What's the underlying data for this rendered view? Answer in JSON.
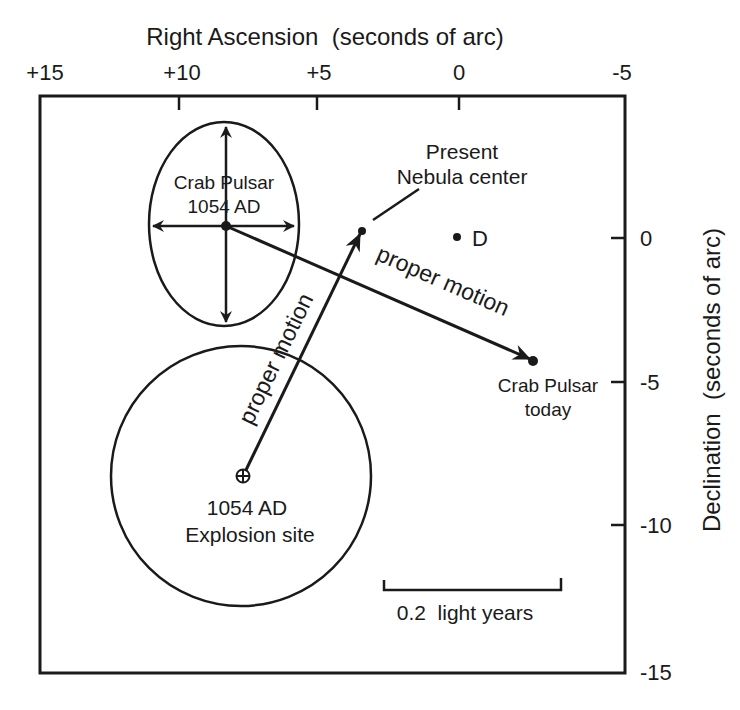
{
  "figure": {
    "x_axis": {
      "title": "Right Ascension  (seconds of arc)",
      "ticks": [
        "+15",
        "+10",
        "+5",
        "0",
        "-5"
      ]
    },
    "y_axis": {
      "title": "Declination  (seconds of arc)",
      "ticks": [
        "0",
        "-5",
        "-10",
        "-15"
      ]
    },
    "labels": {
      "pulsar_1054_line1": "Crab Pulsar",
      "pulsar_1054_line2": "1054 AD",
      "nebula_line1": "Present",
      "nebula_line2": "Nebula center",
      "point_d": "D",
      "motion_pulsar": "proper motion",
      "motion_nebula": "proper motion",
      "pulsar_today_line1": "Crab Pulsar",
      "pulsar_today_line2": "today",
      "explosion_line1": "1054 AD",
      "explosion_line2": "Explosion site",
      "scale_bar": "0.2  light years"
    },
    "points": {
      "pulsar_1054": {
        "ra": 8.5,
        "dec": 0.4
      },
      "nebula_center": {
        "ra": 3.4,
        "dec": 0.2
      },
      "point_d": {
        "ra": 0.1,
        "dec": 0
      },
      "pulsar_today": {
        "ra": -2.5,
        "dec": -4.3
      },
      "explosion_site": {
        "ra": 7.7,
        "dec": -8.3
      }
    },
    "colors": {
      "ink": "#1a1a1a",
      "background": "#ffffff"
    }
  }
}
